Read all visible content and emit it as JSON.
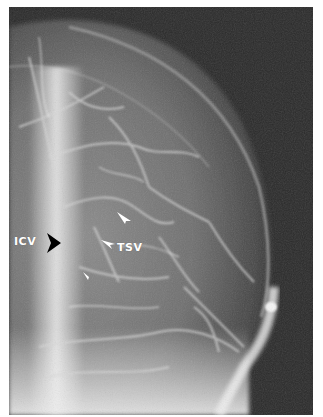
{
  "figure": {
    "type": "cerebral venous angiogram radiograph",
    "background_color": "#ffffff",
    "labels": [
      {
        "id": "icv",
        "text": "ICV"
      },
      {
        "id": "tsv",
        "text": "TSV"
      }
    ],
    "markers": [
      {
        "id": "icv-arrow",
        "kind": "black-arrow",
        "direction": "right",
        "color": "#000000"
      },
      {
        "id": "tsv-arrowhead",
        "kind": "white-arrowhead",
        "direction": "left",
        "color": "#ffffff"
      },
      {
        "id": "upper-arrowhead",
        "kind": "white-arrowhead",
        "direction": "down-right",
        "color": "#ffffff"
      },
      {
        "id": "lower-arrowhead",
        "kind": "white-arrowhead",
        "direction": "up-left",
        "color": "#ffffff"
      }
    ]
  }
}
